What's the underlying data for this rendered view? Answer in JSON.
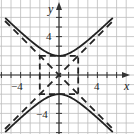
{
  "chart_data": {
    "type": "line",
    "title": "",
    "xlabel": "x",
    "ylabel": "y",
    "xlim": [
      -6,
      7.5
    ],
    "ylim": [
      -6,
      7.5
    ],
    "grid": true,
    "x_tick_labels": [
      "-4",
      "4"
    ],
    "y_tick_labels": [
      "4",
      "-4"
    ],
    "equation": "y^2/4 - x^2/4 = 1",
    "vertices": [
      [
        0,
        2
      ],
      [
        0,
        -2
      ]
    ],
    "asymptotes": [
      "y = x",
      "y = -x"
    ],
    "central_rectangle": {
      "x": [
        -2,
        2
      ],
      "y": [
        -2,
        2
      ]
    },
    "series": [
      {
        "name": "upper branch",
        "style": "solid",
        "x": [
          -6,
          -4,
          -3,
          -2,
          -1,
          0,
          1,
          2,
          3,
          4,
          6
        ],
        "y": [
          6.32,
          4.47,
          3.61,
          2.83,
          2.24,
          2,
          2.24,
          2.83,
          3.61,
          4.47,
          6.32
        ]
      },
      {
        "name": "lower branch",
        "style": "solid",
        "x": [
          -6,
          -4,
          -3,
          -2,
          -1,
          0,
          1,
          2,
          3,
          4,
          6
        ],
        "y": [
          -6.32,
          -4.47,
          -3.61,
          -2.83,
          -2.24,
          -2,
          -2.24,
          -2.83,
          -3.61,
          -4.47,
          -6.32
        ]
      },
      {
        "name": "asymptote y=x",
        "style": "dashed",
        "x": [
          -6,
          6
        ],
        "y": [
          -6,
          6
        ]
      },
      {
        "name": "asymptote y=-x",
        "style": "dashed",
        "x": [
          -6,
          6
        ],
        "y": [
          6,
          -6
        ]
      }
    ]
  },
  "labels": {
    "x_axis": "x",
    "y_axis": "y",
    "x_neg4": "−4",
    "x_pos4": "4",
    "y_pos4": "4",
    "y_neg4": "−4"
  },
  "colors": {
    "curve": "#222222",
    "grid": "#bbbbbb",
    "axis": "#333333"
  }
}
